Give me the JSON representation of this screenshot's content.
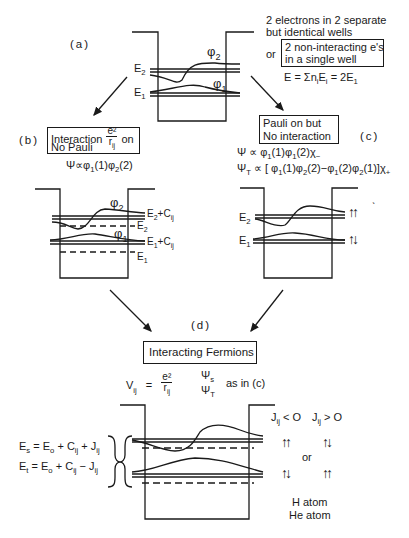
{
  "panels": {
    "a": {
      "label": "(a)",
      "description_line1": "2 electrons in 2 separate",
      "description_line2": "but identical wells",
      "or": "or",
      "boxed_line1": "2 non-interacting e's",
      "boxed_line2": "in a single well",
      "energy_eq": "E = Σn",
      "energy_eq_sub": "i",
      "energy_eq_mid": "E",
      "energy_eq_sub2": "i",
      "energy_eq_end": " = 2E",
      "energy_eq_sub3": "1",
      "levels": {
        "E2": "E",
        "E2_sub": "2",
        "E1": "E",
        "E1_sub": "1"
      },
      "wavefunctions": {
        "phi2": "φ",
        "phi2_sub": "2",
        "phi1": "φ",
        "phi1_sub": "1"
      }
    },
    "b": {
      "label": "(b)",
      "box_line1": "Interaction",
      "frac_num": "e²",
      "frac_den": "r",
      "frac_den_sub": "ij",
      "box_on": "on",
      "box_line2": "No Pauli",
      "psi": "Ψ∝φ",
      "psi_s1": "1",
      "psi_m1": "(1)φ",
      "psi_s2": "2",
      "psi_m2": "(2)",
      "levels": {
        "E2C": "E",
        "E2C_sub": "2",
        "E2C_rest": "+C",
        "E2C_sub2": "ij",
        "E2": "E",
        "E2_sub": "2",
        "E1C": "E",
        "E1C_sub": "1",
        "E1C_rest": "+C",
        "E1C_sub2": "ij",
        "E1": "E",
        "E1_sub": "1"
      },
      "wavefunctions": {
        "phi2": "φ",
        "phi2_sub": "2",
        "phi1": "φ",
        "phi1_sub": "1"
      }
    },
    "c": {
      "label": "(c)",
      "box_line1": "Pauli on but",
      "box_line2": "No interaction",
      "psi_s": "Ψ ∝ φ",
      "psi_s_a": "1",
      "psi_s_b": "(1)φ",
      "psi_s_c": "1",
      "psi_s_d": "(2)χ",
      "psi_s_e": "−",
      "psi_t": "Ψ",
      "psi_t_sub": "T",
      "psi_t_body": " ∝ [ φ",
      "psi_t_a": "1",
      "psi_t_b": "(1)φ",
      "psi_t_c": "2",
      "psi_t_d": "(2)−φ",
      "psi_t_e": "1",
      "psi_t_f": "(2)φ",
      "psi_t_g": "2",
      "psi_t_h": "(1)]χ",
      "psi_t_i": "+",
      "stray_mark": "ˎ",
      "levels": {
        "E2": "E",
        "E2_sub": "2",
        "E1": "E",
        "E1_sub": "1"
      },
      "spins": {
        "upper": "↑↑",
        "lower": "↑↓"
      }
    },
    "d": {
      "label": "(d)",
      "box": "Interacting Fermions",
      "V": "V",
      "V_sub": "ij",
      "eq": "=",
      "frac_num": "e²",
      "frac_den": "r",
      "frac_den_sub": "ij",
      "psi_s": "Ψ",
      "psi_s_sub": "s",
      "psi_t": "Ψ",
      "psi_t_sub": "T",
      "as_in": "as in (c)",
      "Es": {
        "a": "E",
        "a_sub": "s",
        "b": " = E",
        "b_sub": "o",
        "c": " + C",
        "c_sub": "ij",
        "d": " + J",
        "d_sub": "ij"
      },
      "Et": {
        "a": "E",
        "a_sub": "t",
        "b": " = E",
        "b_sub": "o",
        "c": " + C",
        "c_sub": "ij",
        "d": " − J",
        "d_sub": "ij"
      },
      "J_neg": "J",
      "J_neg_sub": "ij",
      "J_neg_rest": " < O",
      "J_pos": "J",
      "J_pos_sub": "ij",
      "J_pos_rest": " > O",
      "spins": {
        "r1c1": "↑↑",
        "r1c2": "↑↓",
        "r2c1": "↑↓",
        "r2c2": "↑↑"
      },
      "or": "or",
      "h_atom": "H atom",
      "he_atom": "He atom"
    }
  }
}
